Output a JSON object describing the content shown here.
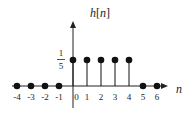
{
  "figure": {
    "title": "h[n]",
    "x_axis_label": "n",
    "y_tick": {
      "numerator": "1",
      "denominator": "5"
    },
    "color": "#111111"
  },
  "chart_data": {
    "type": "stem",
    "title": "h[n]",
    "xlabel": "n",
    "ylabel": "",
    "x": [
      -4,
      -3,
      -2,
      -1,
      0,
      1,
      2,
      3,
      4,
      5,
      6
    ],
    "values": [
      0,
      0,
      0,
      0,
      0.2,
      0.2,
      0.2,
      0.2,
      0.2,
      0,
      0
    ],
    "tick_labels": [
      "-4",
      "-3",
      "-2",
      "-1",
      "0",
      "1",
      "2",
      "3",
      "4",
      "5",
      "6"
    ],
    "y_tick_labels": [
      "1/5"
    ],
    "grid": false
  }
}
